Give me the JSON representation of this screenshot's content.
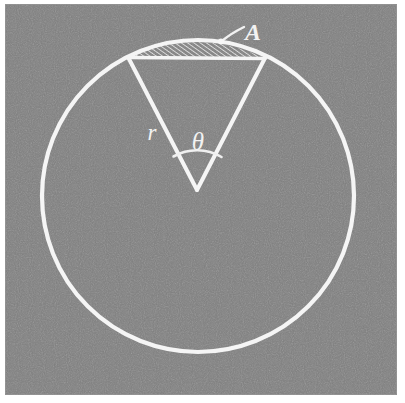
{
  "figure": {
    "canvas": {
      "width": 405,
      "height": 403,
      "background_color": "#ffffff"
    },
    "panel": {
      "name": "gray-textured-panel",
      "x": 5,
      "y": 4,
      "width": 392,
      "height": 391,
      "fill_color": "#808080",
      "texture": "fine grayscale halftone noise"
    },
    "stroke_color": "#f5f5f5",
    "circle": {
      "center_x": 198,
      "center_y": 196,
      "radius": 156,
      "stroke_width": 4.2
    },
    "sector": {
      "apex_x": 197,
      "apex_y": 190,
      "left_point_x": 128,
      "left_point_y": 57,
      "right_point_x": 265,
      "right_point_y": 58,
      "stroke_width": 4.0
    },
    "chord": {
      "x1": 128,
      "y1": 57,
      "x2": 265,
      "y2": 58,
      "stroke_width": 3.6
    },
    "segment_hatch": {
      "description": "circular segment between chord and arc, diagonal hatching",
      "hatch_angle_deg": 55,
      "hatch_spacing_px": 3.4,
      "hatch_stroke_width": 1.5,
      "hatch_color": "#ededed"
    },
    "angle_arc": {
      "radius": 48,
      "stroke_width": 2.6,
      "description": "small arc spanning the vertex angle between the two radii"
    },
    "leader_line": {
      "description": "curved leader from label A to a point on the upper arc",
      "from_x": 243,
      "from_y": 28,
      "to_x": 221,
      "to_y": 41,
      "stroke_width": 2.4,
      "tip_dot_radius": 3.0
    }
  },
  "labels": {
    "radius": {
      "text": "r",
      "name": "radius-label",
      "x": 152,
      "y": 140,
      "font_size": 23,
      "bold": false
    },
    "angle": {
      "text": "θ",
      "name": "angle-theta-label",
      "x": 198,
      "y": 150,
      "font_size": 25,
      "bold": false
    },
    "area": {
      "text": "A",
      "name": "area-label",
      "x": 253,
      "y": 40,
      "font_size": 24,
      "bold": true
    }
  },
  "legend_meanings": {
    "r": "radius of the circle",
    "theta": "central angle of the sector",
    "A": "area of the shaded circular segment"
  }
}
